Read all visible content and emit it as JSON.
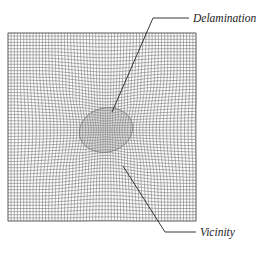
{
  "figure": {
    "type": "finite element mesh with delamination",
    "mesh_color": "#555555",
    "labels": {
      "delamination": "Delamination",
      "vicinity": "Vicinity"
    }
  }
}
